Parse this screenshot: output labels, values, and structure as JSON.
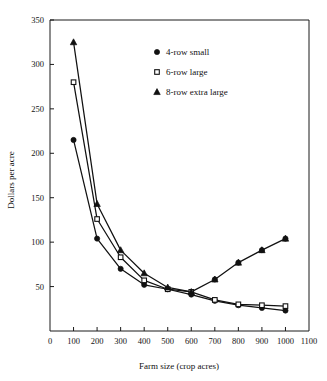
{
  "chart_data": {
    "type": "line",
    "title": "",
    "xlabel": "Farm size (crop acres)",
    "ylabel": "Dollars per acre",
    "xlim": [
      0,
      1100
    ],
    "ylim": [
      0,
      350
    ],
    "xticks": [
      0,
      100,
      200,
      300,
      400,
      500,
      600,
      700,
      800,
      900,
      1000,
      1100
    ],
    "yticks": [
      0,
      50,
      100,
      150,
      200,
      250,
      300,
      350
    ],
    "xtick_labels": [
      "0",
      "100",
      "200",
      "300",
      "400",
      "500",
      "600",
      "700",
      "800",
      "900",
      "1000",
      "1100"
    ],
    "ytick_labels": [
      "",
      "50",
      "100",
      "150",
      "200",
      "250",
      "300",
      "350"
    ],
    "grid": false,
    "legend_position": "upper center",
    "x": [
      100,
      200,
      300,
      400,
      500,
      600,
      700,
      800,
      900,
      1000
    ],
    "series": [
      {
        "name": "4-row small",
        "marker": "filled-circle",
        "values": [
          215,
          104,
          70,
          52,
          47,
          41,
          34,
          29,
          26,
          23
        ]
      },
      {
        "name": "6-row large",
        "marker": "open-square",
        "values": [
          280,
          126,
          83,
          57,
          47,
          44,
          35,
          30,
          29,
          28
        ]
      },
      {
        "name": "8-row extra large",
        "marker": "filled-triangle",
        "values": [
          325,
          143,
          91,
          65,
          49,
          44,
          58,
          77,
          91,
          104
        ]
      }
    ],
    "series_note": "Third plotted upturn curve uses filled circle markers on the right branch"
  },
  "legend": {
    "items": [
      {
        "label": "4-row small",
        "marker": "filled-circle"
      },
      {
        "label": "6-row large",
        "marker": "open-square"
      },
      {
        "label": "8-row extra large",
        "marker": "filled-triangle"
      }
    ]
  },
  "axes": {
    "x_title": "Farm size (crop acres)",
    "y_title": "Dollars per acre"
  }
}
